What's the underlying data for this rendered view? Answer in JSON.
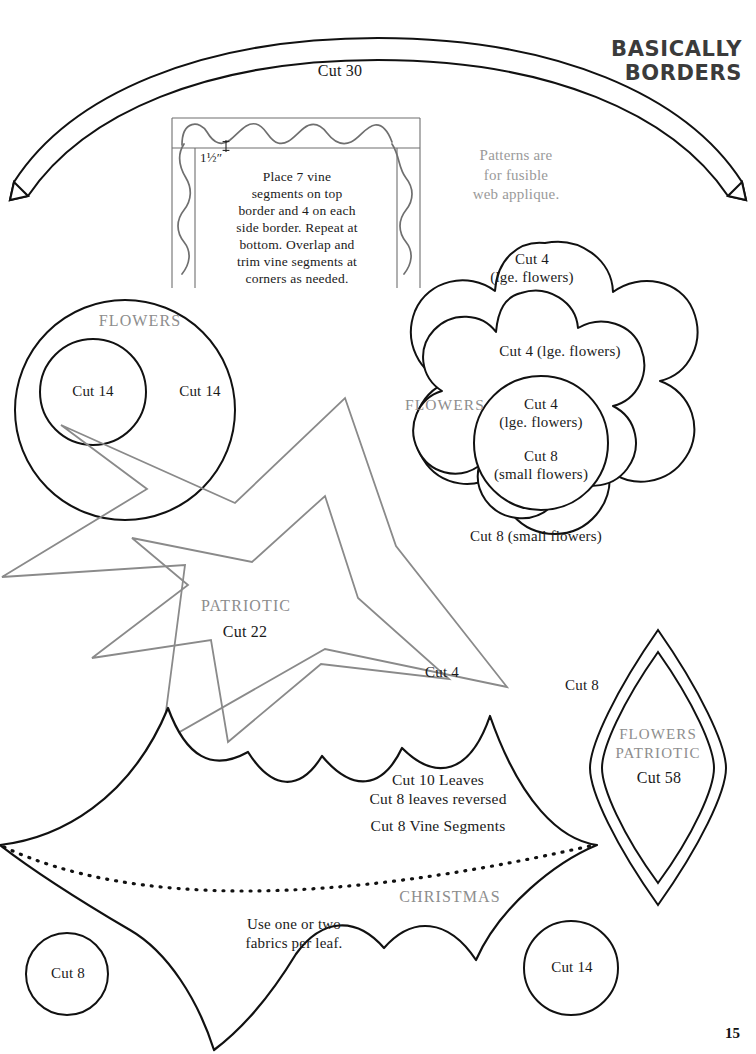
{
  "page": {
    "page_number": "15",
    "brand_line1": "BASICALLY",
    "brand_line2": "BORDERS",
    "colors": {
      "ink": "#1a1a1a",
      "gray_ink": "#8d8d8d",
      "gray_outline": "#909090",
      "background": "#ffffff"
    }
  },
  "arc_border": {
    "label": "Cut 30"
  },
  "vine_diagram": {
    "measure_label": "1½″",
    "instructions": "Place 7 vine\nsegments on top\nborder and 4 on each\nside border. Repeat at\nbottom. Overlap and\ntrim vine segments at\ncorners as needed."
  },
  "fusible_note": {
    "text": "Patterns are\nfor fusible\nweb applique."
  },
  "circles_group": {
    "heading": "FLOWERS",
    "outer_label": "Cut 14",
    "inner_label": "Cut 14"
  },
  "flower_group": {
    "heading": "FLOWERS",
    "outer_petal_label": "Cut 4\n(lge. flowers)",
    "inner_petal_label": "Cut 4 (lge. flowers)",
    "center_label_top": "Cut 4\n(lge. flowers)",
    "center_label_bottom": "Cut 8\n(small flowers)",
    "small_flower_label": "Cut 8 (small flowers)"
  },
  "star_group": {
    "heading": "PATRIOTIC",
    "inner_label": "Cut 22",
    "outer_label": "Cut 4"
  },
  "leaf_shape": {
    "label": "Cut 8",
    "heading_line1": "FLOWERS",
    "heading_line2": "PATRIOTIC",
    "count_label": "Cut 58"
  },
  "holly_leaf": {
    "label_line1": "Cut 10 Leaves",
    "label_line2": "Cut 8 leaves reversed",
    "label_line3": "Cut 8 Vine Segments",
    "heading": "CHRISTMAS",
    "fabric_note": "Use one or two\nfabrics per leaf."
  },
  "small_circle_left": {
    "label": "Cut 8"
  },
  "small_circle_right": {
    "label": "Cut 14"
  }
}
